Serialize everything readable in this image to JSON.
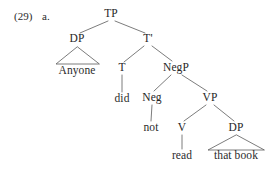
{
  "figure": {
    "example_number": "(29)",
    "example_letter": "a.",
    "background_color": "#ffffff",
    "line_color": "#5a5a5a",
    "text_color": "#262626"
  },
  "tree": {
    "nodes": {
      "tp": {
        "label": "TP",
        "x": 111,
        "y": 14
      },
      "dp_subject": {
        "label": "DP",
        "x": 77,
        "y": 39
      },
      "tbar": {
        "label": "T'",
        "x": 148,
        "y": 39
      },
      "t": {
        "label": "T",
        "x": 122,
        "y": 68
      },
      "negp": {
        "label": "NegP",
        "x": 176,
        "y": 68
      },
      "neg": {
        "label": "Neg",
        "x": 152,
        "y": 98
      },
      "vp": {
        "label": "VP",
        "x": 210,
        "y": 98
      },
      "v": {
        "label": "V",
        "x": 182,
        "y": 128
      },
      "dp_object": {
        "label": "DP",
        "x": 236,
        "y": 128
      }
    },
    "terminals": {
      "anyone": {
        "label": "Anyone",
        "x": 77,
        "y": 71
      },
      "did": {
        "label": "did",
        "x": 122,
        "y": 99
      },
      "not": {
        "label": "not",
        "x": 151,
        "y": 128
      },
      "read": {
        "label": "read",
        "x": 182,
        "y": 156
      },
      "that_book": {
        "label": "that book",
        "x": 236,
        "y": 156
      }
    },
    "sentence": "Anyone did not read that book"
  }
}
